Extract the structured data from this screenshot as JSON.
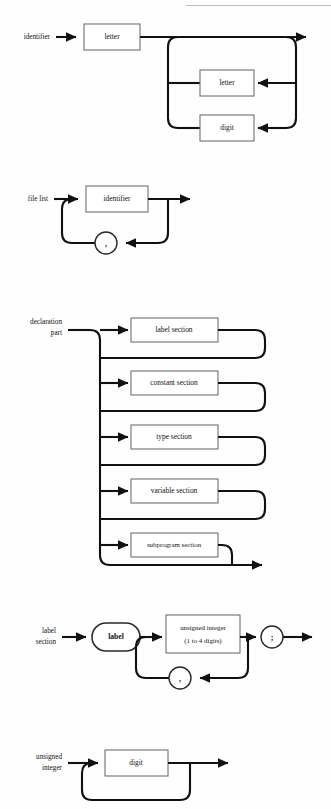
{
  "page": {
    "kind": "syntax-railroad-diagrams",
    "width": 331,
    "height": 809,
    "background": "#fefefe",
    "ink": "#111111"
  },
  "diagrams": [
    {
      "id": "identifier",
      "name": "identifier",
      "label": "identifier",
      "boxes": [
        {
          "id": "letter-first",
          "label": "letter"
        },
        {
          "id": "letter-loop",
          "label": "letter"
        },
        {
          "id": "digit-loop",
          "label": "digit"
        }
      ]
    },
    {
      "id": "file-list",
      "name": "file list",
      "label": "file list",
      "boxes": [
        {
          "id": "identifier-ref",
          "label": "identifier"
        }
      ],
      "separators": [
        {
          "id": "comma",
          "label": ","
        }
      ]
    },
    {
      "id": "declaration-part",
      "name": "declaration part",
      "label_line1": "declaration",
      "label_line2": "part",
      "boxes": [
        {
          "id": "label-section",
          "label": "label section"
        },
        {
          "id": "constant-section",
          "label": "constant section"
        },
        {
          "id": "type-section",
          "label": "type section"
        },
        {
          "id": "variable-section",
          "label": "variable section"
        },
        {
          "id": "subprogram-section",
          "label": "subprogram section"
        }
      ]
    },
    {
      "id": "label-section",
      "name": "label section",
      "label_line1": "label",
      "label_line2": "section",
      "terminals": [
        {
          "id": "label-keyword",
          "label": "label"
        }
      ],
      "boxes": [
        {
          "id": "unsigned-integer-ref",
          "label_line1": "unsigned integer",
          "label_line2": "(1 to 4 digits)"
        }
      ],
      "separators": [
        {
          "id": "comma",
          "label": ","
        },
        {
          "id": "semicolon",
          "label": ";"
        }
      ]
    },
    {
      "id": "unsigned-integer",
      "name": "unsigned integer",
      "label_line1": "unsigned",
      "label_line2": "integer",
      "boxes": [
        {
          "id": "digit-ref",
          "label": "digit"
        }
      ]
    }
  ]
}
